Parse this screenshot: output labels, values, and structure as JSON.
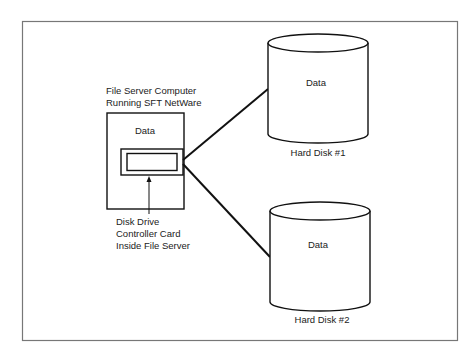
{
  "diagram": {
    "server": {
      "title_line1": "File Server Computer",
      "title_line2": "Running SFT NetWare",
      "data_label": "Data",
      "card_label_line1": "Disk Drive",
      "card_label_line2": "Controller Card",
      "card_label_line3": "Inside File Server"
    },
    "disks": [
      {
        "data_label": "Data",
        "name": "Hard Disk #1"
      },
      {
        "data_label": "Data",
        "name": "Hard Disk #2"
      }
    ],
    "colors": {
      "line": "#111111",
      "frame": "#777777",
      "background": "#ffffff"
    }
  }
}
